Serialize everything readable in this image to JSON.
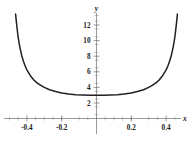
{
  "figure": {
    "background_color": "#ffffff",
    "curve_color": "#231f20",
    "axis_color": "#6e6e72",
    "text_color": "#1a1a1a"
  },
  "axes": {
    "x_axis_label": "x",
    "y_axis_label": "y",
    "x_tick_labels": [
      "-0.4",
      "-0.2",
      "0.2",
      "0.4"
    ],
    "y_tick_labels": [
      "2",
      "4",
      "6",
      "8",
      "10",
      "12"
    ]
  },
  "chart_data": {
    "type": "line",
    "title": "",
    "xlabel": "x",
    "ylabel": "y",
    "grid": false,
    "legend_position": "none",
    "xlim": [
      -0.5,
      0.5
    ],
    "ylim": [
      0,
      14
    ],
    "x_ticks": [
      -0.4,
      -0.2,
      0.2,
      0.4
    ],
    "y_ticks": [
      2,
      4,
      6,
      8,
      10,
      12
    ],
    "x_minor_tick_step": 0.05,
    "y_minor_tick_step": 0.5,
    "x_tick_labels": [
      "-0.4",
      "-0.2",
      "0.2",
      "0.4"
    ],
    "y_tick_labels": [
      "2",
      "4",
      "6",
      "8",
      "10",
      "12"
    ],
    "annotations": [],
    "series": [
      {
        "name": "curve",
        "x": [
          -0.465,
          -0.46,
          -0.455,
          -0.45,
          -0.445,
          -0.44,
          -0.43,
          -0.42,
          -0.41,
          -0.4,
          -0.38,
          -0.36,
          -0.34,
          -0.32,
          -0.3,
          -0.27,
          -0.24,
          -0.2,
          -0.16,
          -0.12,
          -0.08,
          -0.04,
          0.0,
          0.04,
          0.08,
          0.12,
          0.16,
          0.2,
          0.24,
          0.27,
          0.3,
          0.32,
          0.34,
          0.36,
          0.38,
          0.4,
          0.41,
          0.42,
          0.43,
          0.44,
          0.445,
          0.45,
          0.455,
          0.46,
          0.465
        ],
        "y": [
          13.4,
          12.3,
          11.3,
          10.4,
          9.7,
          9.1,
          8.1,
          7.35,
          6.75,
          6.25,
          5.5,
          4.95,
          4.55,
          4.25,
          4.0,
          3.7,
          3.5,
          3.28,
          3.15,
          3.06,
          3.02,
          3.0,
          3.0,
          3.0,
          3.02,
          3.06,
          3.15,
          3.28,
          3.5,
          3.7,
          4.0,
          4.25,
          4.55,
          4.95,
          5.5,
          6.25,
          6.75,
          7.35,
          8.1,
          9.1,
          9.7,
          10.4,
          11.3,
          12.3,
          13.4
        ],
        "description_note": "U-shaped even function, minimum y=3 at x=0, steep rise toward vertical asymptotes near x = -0.5 and x = 0.5"
      }
    ]
  }
}
